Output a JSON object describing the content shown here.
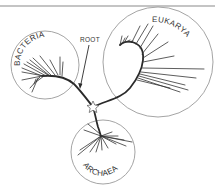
{
  "diagram": {
    "type": "unrooted phylogenetic tree of life",
    "labels": {
      "bacteria": "BACTERIA",
      "eukarya": "EUKARYA",
      "archaea": "ARCHAEA",
      "root": "ROOT"
    },
    "domains": [
      {
        "name": "BACTERIA",
        "circle": {
          "cx": 45,
          "cy": 65,
          "r": 34
        }
      },
      {
        "name": "EUKARYA",
        "circle": {
          "cx": 158,
          "cy": 62,
          "r": 55
        }
      },
      {
        "name": "ARCHAEA",
        "circle": {
          "cx": 103,
          "cy": 152,
          "r": 32
        }
      }
    ],
    "root_marker": {
      "x": 93,
      "y": 107,
      "shape": "star"
    },
    "colors": {
      "line": "#2a2a2a",
      "circle": "#9a9a9a",
      "text": "#333333",
      "background": "#ffffff"
    }
  }
}
